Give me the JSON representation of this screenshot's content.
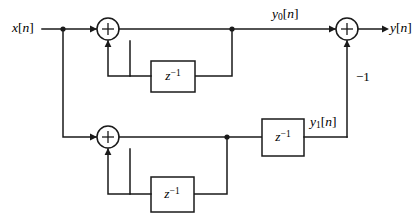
{
  "diagram": {
    "type": "block-diagram",
    "canvas": {
      "width": 420,
      "height": 219
    },
    "colors": {
      "background": "#ffffff",
      "line": "#1a1a1a",
      "text": "#000000",
      "block_fill": "#ffffff"
    },
    "signals": {
      "input": {
        "name": "x",
        "index": "n",
        "label": "x[n]",
        "x": 12,
        "y": 22
      },
      "output": {
        "name": "y",
        "index": "n",
        "label": "y[n]",
        "x": 390,
        "y": 22
      },
      "intermediate_top": {
        "name": "y0",
        "sub": "0",
        "index": "n",
        "label": "y0[n]",
        "x": 272,
        "y": 8
      },
      "intermediate_bottom": {
        "name": "y1",
        "sub": "1",
        "index": "n",
        "label": "y1[n]",
        "x": 310,
        "y": 116
      }
    },
    "gain": {
      "value": "-1",
      "label": "−1",
      "x": 356,
      "y": 70
    },
    "adders": [
      {
        "id": "adder-top",
        "label": "+",
        "cx": 108,
        "cy": 29,
        "r": 11
      },
      {
        "id": "adder-bottom",
        "label": "+",
        "cx": 108,
        "cy": 137,
        "r": 11
      },
      {
        "id": "adder-output",
        "label": "+",
        "cx": 347,
        "cy": 29,
        "r": 11
      }
    ],
    "delay_blocks": [
      {
        "id": "delay-1",
        "label": "z",
        "exponent": "−1",
        "x": 151,
        "y": 61,
        "w": 44,
        "h": 31
      },
      {
        "id": "delay-2",
        "label": "z",
        "exponent": "−1",
        "x": 262,
        "y": 119,
        "w": 42,
        "h": 37
      },
      {
        "id": "delay-3",
        "label": "z",
        "exponent": "−1",
        "x": 151,
        "y": 177,
        "w": 43,
        "h": 35
      }
    ],
    "junctions": [
      {
        "id": "branch-input",
        "x": 63,
        "y": 29,
        "r": 2.6
      },
      {
        "id": "branch-top-feedback",
        "x": 232,
        "y": 29,
        "r": 2.6
      },
      {
        "id": "branch-bottom-feedback",
        "x": 227,
        "y": 137,
        "r": 2.6
      }
    ]
  }
}
